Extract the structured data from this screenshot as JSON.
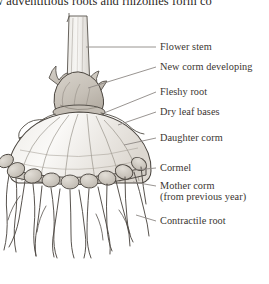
{
  "figure": {
    "title_fragment": "w adventitious roots and rhizomes form co",
    "background_color": "#ffffff",
    "ink_color": "#3a3531",
    "leader_color": "#8d8884",
    "fill_light": "#f4f2ef",
    "fill_mid": "#dcd8d2",
    "fill_shade": "#c9c4bd"
  },
  "labels": [
    {
      "id": "flower-stem",
      "text": "Flower stem",
      "x": 160,
      "y": 50
    },
    {
      "id": "new-corm",
      "text": "New corm developing",
      "x": 160,
      "y": 70
    },
    {
      "id": "fleshy-root",
      "text": "Fleshy root",
      "x": 160,
      "y": 95
    },
    {
      "id": "dry-leaf-bases",
      "text": "Dry leaf bases",
      "x": 160,
      "y": 115
    },
    {
      "id": "daughter-corm",
      "text": "Daughter corm",
      "x": 160,
      "y": 141
    },
    {
      "id": "cormel",
      "text": "Cormel",
      "x": 160,
      "y": 171
    },
    {
      "id": "mother-corm",
      "text": "Mother corm",
      "x": 160,
      "y": 189
    },
    {
      "id": "mother-corm-note",
      "text": "(from previous year)",
      "x": 160,
      "y": 200
    },
    {
      "id": "contractile-root",
      "text": "Contractile root",
      "x": 160,
      "y": 224
    }
  ]
}
